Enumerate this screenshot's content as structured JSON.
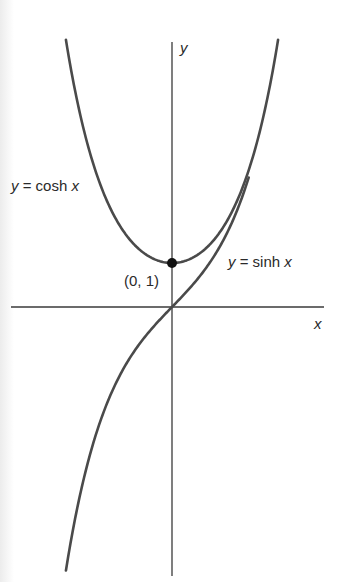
{
  "chart_data": {
    "type": "line",
    "title": "",
    "xlabel": "x",
    "ylabel": "y",
    "grid": false,
    "legend": "inline labels",
    "xlim": [
      -3.75,
      3.55
    ],
    "ylim": [
      -6.1,
      6.1
    ],
    "series": [
      {
        "name": "y = cosh x",
        "function": "cosh",
        "x_range": [
          -2.49,
          2.49
        ],
        "x": [
          -2.49,
          -2.0,
          -1.5,
          -1.0,
          -0.5,
          0.0,
          0.5,
          1.0,
          1.5,
          2.0,
          2.49
        ],
        "values": [
          6.07,
          3.76,
          2.35,
          1.54,
          1.13,
          1.0,
          1.13,
          1.54,
          2.35,
          3.76,
          6.07
        ],
        "label": {
          "text_var": "y",
          "text_eq": " = cosh ",
          "text_arg": "x"
        }
      },
      {
        "name": "y = sinh x",
        "function": "sinh",
        "x_range": [
          -2.49,
          1.8
        ],
        "x": [
          -2.49,
          -2.0,
          -1.5,
          -1.0,
          -0.5,
          0.0,
          0.5,
          1.0,
          1.5,
          1.8
        ],
        "values": [
          -5.98,
          -3.63,
          -2.13,
          -1.18,
          -0.52,
          0.0,
          0.52,
          1.18,
          2.13,
          2.94
        ],
        "label": {
          "text_var": "y",
          "text_eq": " = sinh ",
          "text_arg": "x"
        }
      }
    ],
    "annotations": [
      {
        "type": "point",
        "x": 0,
        "y": 1,
        "text": "(0, 1)"
      }
    ],
    "axes": {
      "x_label": "x",
      "y_label": "y"
    }
  },
  "layout": {
    "origin_px": [
      172,
      307
    ],
    "x_scale_px": 42.6,
    "y_scale_px": 44,
    "x_axis_px": [
      11,
      324
    ],
    "y_axis_px": [
      42,
      576
    ],
    "curve_color": "#4a4a4a",
    "axis_color": "#3a3a3a"
  },
  "labels": {
    "y_axis": "y",
    "x_axis": "x",
    "point": "(0, 1)",
    "cosh": {
      "var": "y",
      "eq": " = cosh ",
      "arg": "x"
    },
    "sinh": {
      "var": "y",
      "eq": " = sinh ",
      "arg": "x"
    }
  }
}
